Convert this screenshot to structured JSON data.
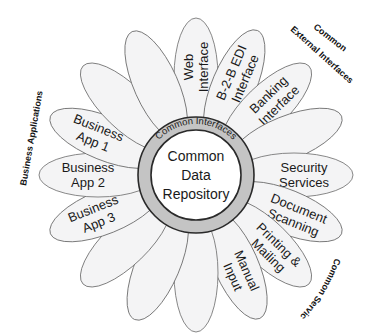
{
  "diagram": {
    "center": {
      "x": 196,
      "y": 175
    },
    "core": {
      "lines": [
        "Common",
        "Data",
        "Repository"
      ]
    },
    "ring": {
      "label": "Common Interfaces"
    },
    "petals": [
      {
        "angle": -90,
        "lines": [
          "Web",
          "Interface"
        ]
      },
      {
        "angle": -67,
        "lines": [
          "B-2-B EDI",
          "Interface"
        ]
      },
      {
        "angle": -44,
        "lines": [
          "Banking",
          "Interface"
        ]
      },
      {
        "angle": -22,
        "lines": []
      },
      {
        "angle": 0,
        "lines": [
          "Security",
          "Services"
        ]
      },
      {
        "angle": 22,
        "lines": [
          "Document",
          "Scanning"
        ]
      },
      {
        "angle": 44,
        "lines": [
          "Printing &",
          "Mailing"
        ]
      },
      {
        "angle": 66,
        "lines": [
          "Manual",
          "Input"
        ]
      },
      {
        "angle": 90,
        "lines": []
      },
      {
        "angle": 113,
        "lines": []
      },
      {
        "angle": 136,
        "lines": []
      },
      {
        "angle": 158,
        "lines": [
          "Business",
          "App 3"
        ]
      },
      {
        "angle": 180,
        "lines": [
          "Business",
          "App 2"
        ]
      },
      {
        "angle": 202,
        "lines": [
          "Business",
          "App 1"
        ]
      },
      {
        "angle": 224,
        "lines": []
      },
      {
        "angle": 246,
        "lines": []
      }
    ],
    "group_labels": {
      "business_applications": "Business Applications",
      "common_external_interfaces_line1": "Common",
      "common_external_interfaces_line2": "External Interfaces",
      "common_services": "Common Services"
    },
    "colors": {
      "petal_fill": "#f4f4f5",
      "petal_stroke": "#6a6a6a",
      "ring_fill": "#c4c4c4",
      "ring_stroke": "#2a2a2a",
      "core_fill": "#ffffff"
    }
  }
}
